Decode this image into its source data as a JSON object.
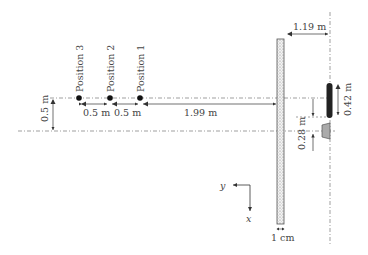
{
  "diagram": {
    "type": "experimental-setup-plan-view",
    "positions": [
      {
        "label": "Position 3",
        "x": 79
      },
      {
        "label": "Position 2",
        "x": 110
      },
      {
        "label": "Position 1",
        "x": 140
      }
    ],
    "dimensions": {
      "spacing_3_2": "0.5 m",
      "spacing_2_1": "0.5 m",
      "pos1_to_wall": "1.99 m",
      "lateral_offset": "0.5 m",
      "wall_to_line": "1.19 m",
      "bar_length": "0.42 m",
      "source_offset": "0.28 m",
      "wall_thickness": "1 cm"
    },
    "axes": {
      "y_label": "y",
      "x_label": "x"
    },
    "colors": {
      "line": "#555555",
      "wall_fill": "#e8e8e8",
      "bar": "#222222",
      "source": "#999999"
    }
  }
}
